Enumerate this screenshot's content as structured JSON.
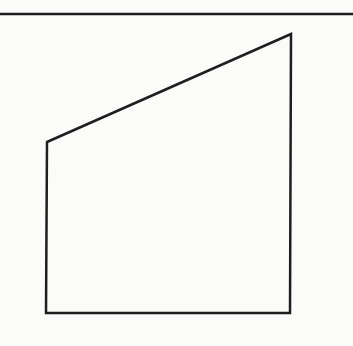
{
  "diagram": {
    "type": "geometry-figure",
    "background": "#fbfbf9",
    "stroke_color": "#1e1e1e",
    "top_rule": {
      "y": 14,
      "x1": 0,
      "x2": 353
    },
    "shape": {
      "name": "right-trapezoid",
      "vertices": [
        [
          47,
          142
        ],
        [
          291,
          34
        ],
        [
          290,
          313
        ],
        [
          46,
          313
        ]
      ]
    }
  }
}
